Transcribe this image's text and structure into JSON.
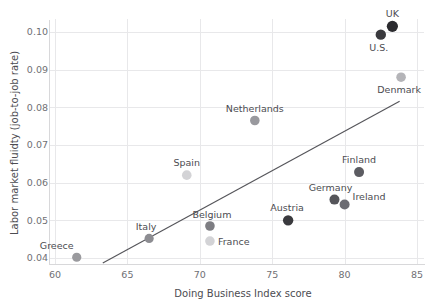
{
  "chart_data": {
    "type": "scatter",
    "title": "",
    "xlabel": "Doing Business Index score",
    "ylabel": "Labor market fluidty (job-to-job rate)",
    "xlim": [
      59.6,
      85.5
    ],
    "ylim": [
      0.0385,
      0.1035
    ],
    "xticks": [
      60,
      65,
      70,
      75,
      80,
      85
    ],
    "xtick_labels": [
      "60",
      "65",
      "70",
      "75",
      "80",
      "85"
    ],
    "yticks": [
      0.04,
      0.05,
      0.06,
      0.07,
      0.08,
      0.09,
      0.1
    ],
    "ytick_labels": [
      "0.04",
      "0.05",
      "0.06",
      "0.07",
      "0.08",
      "0.09",
      "0.10"
    ],
    "grid": true,
    "legend": "none",
    "points": [
      {
        "label": "Greece",
        "x": 61.5,
        "y": 0.0402,
        "color": "#9a9a9e",
        "r": 4.6,
        "label_dx": -20,
        "label_dy": -8,
        "anchor": "middle"
      },
      {
        "label": "Italy",
        "x": 66.5,
        "y": 0.0452,
        "color": "#8d8d92",
        "r": 4.6,
        "label_dx": -3,
        "label_dy": -8,
        "anchor": "middle"
      },
      {
        "label": "Spain",
        "x": 69.1,
        "y": 0.062,
        "color": "#d3d3d6",
        "r": 4.8,
        "label_dx": 0,
        "label_dy": -9,
        "anchor": "middle"
      },
      {
        "label": "Belgium",
        "x": 70.7,
        "y": 0.0485,
        "color": "#7d7d82",
        "r": 4.8,
        "label_dx": 2,
        "label_dy": -8,
        "anchor": "middle"
      },
      {
        "label": "France",
        "x": 70.7,
        "y": 0.0445,
        "color": "#d3d3d6",
        "r": 4.8,
        "label_dx": 8,
        "label_dy": 4,
        "anchor": "start"
      },
      {
        "label": "Netherlands",
        "x": 73.8,
        "y": 0.0765,
        "color": "#99999e",
        "r": 4.8,
        "label_dx": 0,
        "label_dy": -9,
        "anchor": "middle"
      },
      {
        "label": "Austria",
        "x": 76.1,
        "y": 0.05,
        "color": "#3a3a3e",
        "r": 5.2,
        "label_dx": -1,
        "label_dy": -9,
        "anchor": "middle"
      },
      {
        "label": "Germany",
        "x": 79.3,
        "y": 0.0555,
        "color": "#55555a",
        "r": 5.0,
        "label_dx": -4,
        "label_dy": -9,
        "anchor": "middle"
      },
      {
        "label": "Ireland",
        "x": 80.0,
        "y": 0.0542,
        "color": "#6c6c72",
        "r": 5.0,
        "label_dx": 8,
        "label_dy": -5,
        "anchor": "start"
      },
      {
        "label": "Finland",
        "x": 81.0,
        "y": 0.0628,
        "color": "#5c5c62",
        "r": 5.0,
        "label_dx": 0,
        "label_dy": -9,
        "anchor": "middle"
      },
      {
        "label": "U.S.",
        "x": 82.5,
        "y": 0.0993,
        "color": "#3a3a3e",
        "r": 5.2,
        "label_dx": -2,
        "label_dy": 16,
        "anchor": "middle"
      },
      {
        "label": "UK",
        "x": 83.3,
        "y": 0.1015,
        "color": "#2b2b2f",
        "r": 5.6,
        "label_dx": 0,
        "label_dy": -9,
        "anchor": "middle"
      },
      {
        "label": "Denmark",
        "x": 83.9,
        "y": 0.088,
        "color": "#b4b4b8",
        "r": 4.8,
        "label_dx": -2,
        "label_dy": 16,
        "anchor": "middle"
      }
    ],
    "trend_line": {
      "x_start": 63.3,
      "y_start": 0.0387,
      "x_end": 83.8,
      "y_end": 0.0816,
      "color": "#55555a"
    },
    "colors": {
      "grid": "#e8e8ea",
      "axis": "#d8d8da",
      "tick_text": "#6f6f74",
      "axis_title": "#4c4c51",
      "point_label": "#4c4c51"
    }
  }
}
